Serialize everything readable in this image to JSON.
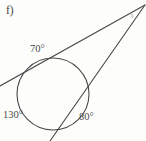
{
  "figure": {
    "part_label": "f)",
    "background_color": "#fdfdfc",
    "stroke_color": "#4a4a4a"
  },
  "labels": {
    "arc_top": "70°",
    "arc_left": "130°",
    "arc_right": "80°",
    "vertex_unknown": "x"
  },
  "chart_data": {
    "type": "diagram",
    "title": "f)",
    "shapes": [
      {
        "name": "circle",
        "kind": "circle",
        "cx": 53,
        "cy": 94,
        "r": 36
      },
      {
        "name": "tangent-line",
        "kind": "line",
        "x1": 0,
        "y1": 86,
        "x2": 145,
        "y2": 5
      },
      {
        "name": "secant-line",
        "kind": "line",
        "x1": 50,
        "y1": 141,
        "x2": 145,
        "y2": 5
      }
    ],
    "annotations": [
      {
        "text": "70°",
        "x": 30,
        "y": 49
      },
      {
        "text": "130°",
        "x": 4,
        "y": 116
      },
      {
        "text": "80°",
        "x": 80,
        "y": 118
      },
      {
        "text": "x",
        "x": 132,
        "y": 15
      }
    ],
    "values": [
      70,
      130,
      80
    ],
    "categories": [
      "arc_top",
      "arc_left",
      "arc_right"
    ]
  }
}
